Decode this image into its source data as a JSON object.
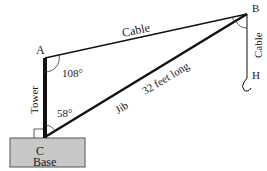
{
  "diagram": {
    "points": {
      "A": {
        "label": "A",
        "x": 45,
        "y": 58
      },
      "B": {
        "label": "B",
        "x": 247,
        "y": 14
      },
      "C": {
        "label": "C",
        "x": 45,
        "y": 137
      },
      "H": {
        "label": "H",
        "x": 248,
        "y": 74
      }
    },
    "labels": {
      "cable_top": "Cable",
      "cable_side": "Cable",
      "tower": "Tower",
      "jib": "Jib",
      "jib_length": "32 feet long",
      "base": "Base",
      "angle_A": "108°",
      "angle_C": "58°"
    },
    "colors": {
      "line": "#111111",
      "base_fill": "#c8c8c8",
      "base_stroke": "#555555"
    }
  }
}
